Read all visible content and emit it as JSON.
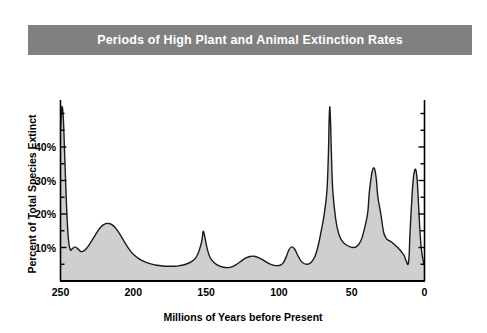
{
  "figure": {
    "title": "Periods of High Plant and Animal Extinction Rates",
    "banner_color": "#808080",
    "title_color": "#ffffff",
    "background_color": "#ffffff"
  },
  "chart_data": {
    "type": "area",
    "title": "Periods of High Plant and Animal Extinction Rates",
    "xlabel": "Millions of Years before Present",
    "ylabel": "Percent of Total Species Extinct",
    "xlim": [
      250,
      0
    ],
    "ylim": [
      0,
      50
    ],
    "x_inverted": true,
    "grid": false,
    "legend": null,
    "xticks": [
      250,
      200,
      150,
      100,
      50,
      0
    ],
    "xtick_labels": [
      "250",
      "200",
      "150",
      "100",
      "50",
      "0"
    ],
    "yticks": [
      10,
      20,
      30,
      40
    ],
    "ytick_labels": [
      "10%",
      "20%",
      "30%",
      "40%"
    ],
    "y_minor_tick_step": 5,
    "axis_color": "#000000",
    "line_color": "#1a1a1a",
    "fill_color": "#cfcfcf",
    "series_name": "Percent of Total Species Extinct",
    "x": [
      250,
      249,
      248,
      247,
      246,
      245,
      244,
      243,
      242,
      240,
      238,
      236,
      234,
      232,
      230,
      228,
      226,
      224,
      222,
      220,
      218,
      216,
      214,
      212,
      210,
      208,
      206,
      204,
      202,
      200,
      196,
      192,
      188,
      184,
      180,
      176,
      172,
      168,
      164,
      160,
      157,
      155,
      153,
      152,
      151,
      149,
      147,
      144,
      141,
      138,
      135,
      132,
      129,
      126,
      123,
      120,
      117,
      114,
      111,
      108,
      105,
      102,
      99,
      97,
      95,
      93,
      91,
      89,
      87,
      85,
      83,
      81,
      79,
      77,
      75,
      73,
      71,
      69,
      67,
      66,
      65.5,
      65,
      64.5,
      64,
      63,
      61,
      59,
      57,
      55,
      53,
      51,
      49,
      47,
      45,
      43,
      41,
      39,
      38,
      37,
      36,
      35,
      34,
      33,
      32,
      30,
      28,
      26,
      24,
      22,
      20,
      18,
      16,
      14,
      13,
      12,
      11.5,
      11,
      10.5,
      10,
      9,
      8,
      7,
      6,
      5,
      4,
      3,
      2,
      1,
      0
    ],
    "y": [
      45,
      52,
      48,
      36,
      24,
      15,
      10.5,
      9.2,
      9.6,
      10.2,
      9.6,
      8.8,
      9.0,
      9.8,
      11.0,
      12.4,
      13.8,
      15.2,
      16.3,
      16.9,
      17.2,
      17.1,
      16.6,
      15.7,
      14.5,
      13.1,
      11.6,
      10.2,
      9.0,
      8.0,
      6.6,
      5.7,
      5.1,
      4.7,
      4.5,
      4.4,
      4.4,
      4.6,
      5.0,
      5.8,
      7.0,
      8.8,
      11.8,
      14.8,
      13.4,
      9.2,
      6.8,
      5.3,
      4.5,
      4.1,
      4.0,
      4.3,
      5.0,
      5.9,
      6.8,
      7.3,
      7.4,
      7.0,
      6.3,
      5.5,
      4.9,
      4.6,
      4.7,
      5.4,
      7.2,
      9.4,
      10.2,
      9.4,
      7.6,
      6.1,
      5.3,
      5.0,
      5.2,
      6.0,
      7.6,
      10.6,
      14.8,
      19.6,
      27.0,
      38.0,
      48.0,
      52.0,
      47.0,
      39.0,
      27.0,
      18.5,
      14.2,
      12.2,
      11.2,
      10.6,
      10.2,
      10.0,
      10.2,
      11.0,
      12.8,
      16.0,
      20.4,
      26.0,
      29.8,
      32.6,
      33.8,
      33.0,
      30.0,
      25.0,
      20.0,
      14.4,
      12.6,
      12.0,
      11.4,
      10.6,
      9.8,
      8.8,
      7.6,
      6.4,
      5.4,
      4.9,
      5.4,
      8.0,
      14.0,
      22.0,
      29.0,
      32.6,
      33.2,
      30.0,
      22.0,
      14.0,
      9.0,
      6.2,
      4.6,
      3.4,
      2.4,
      1.4,
      0.7,
      0.2
    ]
  }
}
